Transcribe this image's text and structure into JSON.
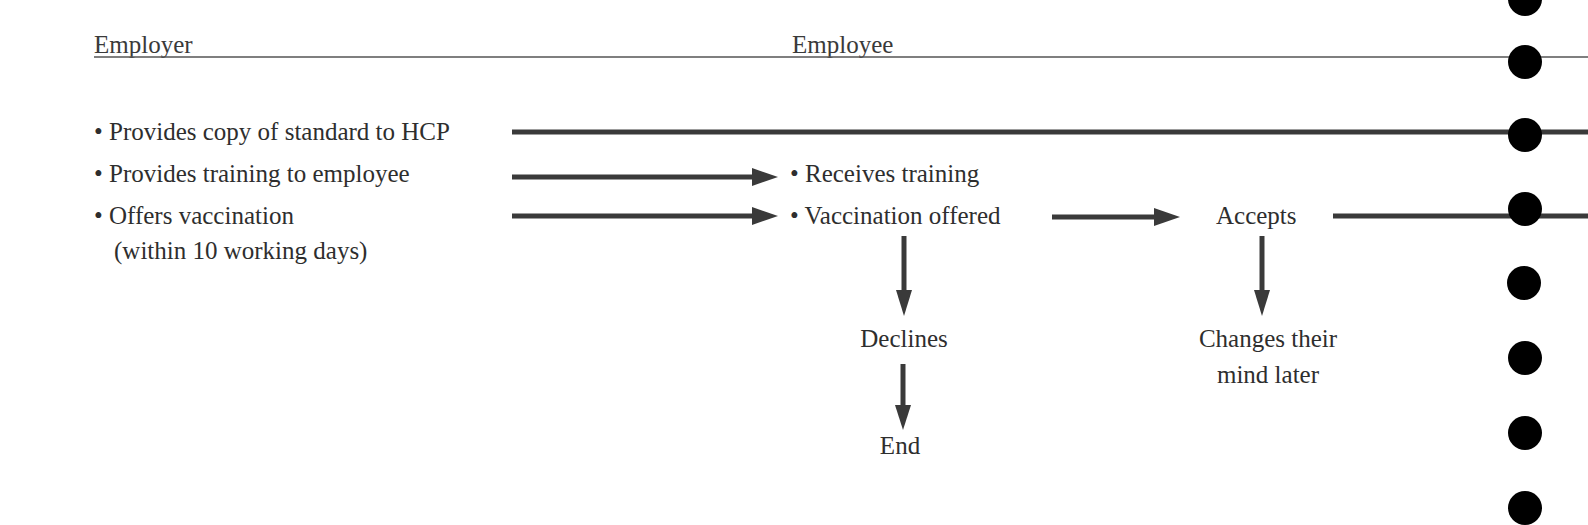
{
  "headers": {
    "employer": "Employer",
    "employee": "Employee"
  },
  "employer_items": [
    {
      "label": "• Provides copy of standard to HCP"
    },
    {
      "label": "• Provides training to employee"
    },
    {
      "label": "• Offers vaccination",
      "sublabel": "(within 10 working days)"
    }
  ],
  "employee_items": [
    {
      "label": "• Receives training"
    },
    {
      "label": "• Vaccination offered"
    }
  ],
  "outcomes": {
    "accepts": "Accepts",
    "declines": "Declines",
    "end": "End",
    "changes_mind_line1": "Changes their",
    "changes_mind_line2": "mind later"
  },
  "colors": {
    "text": "#2e2e2e",
    "line": "#3a3a3a",
    "dot": "#000000",
    "background": "#ffffff"
  },
  "punch_holes": {
    "count": 8
  }
}
